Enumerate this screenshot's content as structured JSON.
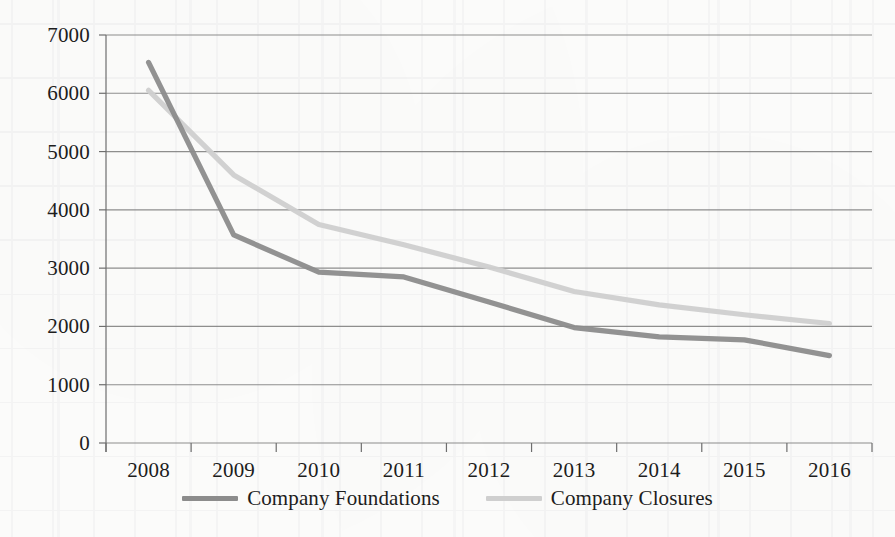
{
  "chart_data": {
    "type": "line",
    "title": "",
    "subtitle": "",
    "xlabel": "",
    "ylabel": "",
    "categories": [
      "2008",
      "2009",
      "2010",
      "2011",
      "2012",
      "2013",
      "2014",
      "2015",
      "2016"
    ],
    "ylim": [
      0,
      7000
    ],
    "ytick_step": 1000,
    "yticks": [
      "7000",
      "6000",
      "5000",
      "4000",
      "3000",
      "2000",
      "1000",
      "0"
    ],
    "ytick_values": [
      7000,
      6000,
      5000,
      4000,
      3000,
      2000,
      1000,
      0
    ],
    "grid": true,
    "grid_axis": "y",
    "legend_position": "bottom",
    "series": [
      {
        "name": "Company Foundations",
        "color": "#8c8c8c",
        "values": [
          6530,
          3570,
          2930,
          2850,
          2420,
          1980,
          1820,
          1770,
          1500
        ]
      },
      {
        "name": "Company Closures",
        "color": "#cfcfcf",
        "values": [
          6050,
          4600,
          3750,
          3400,
          3020,
          2600,
          2370,
          2200,
          2050
        ]
      }
    ],
    "annotations": []
  },
  "axis": {
    "axis_color": "#6e6e6e",
    "grid_color": "#7a7a7a",
    "tick_label_color": "#1d1d1d"
  },
  "legend": {
    "items": [
      {
        "label": "Company Foundations",
        "color": "#8c8c8c"
      },
      {
        "label": "Company Closures",
        "color": "#cfcfcf"
      }
    ]
  }
}
